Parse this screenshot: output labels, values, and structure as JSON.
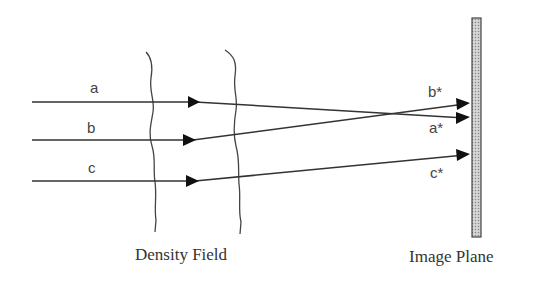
{
  "diagram": {
    "rays": [
      {
        "label": "a",
        "image_label": "a*"
      },
      {
        "label": "b",
        "image_label": "b*"
      },
      {
        "label": "c",
        "image_label": "c*"
      }
    ],
    "density_field_label": "Density Field",
    "image_plane_label": "Image Plane",
    "colors": {
      "line": "#333333",
      "plane_fill": "#bdbdbd",
      "plane_stroke": "#444444"
    }
  }
}
